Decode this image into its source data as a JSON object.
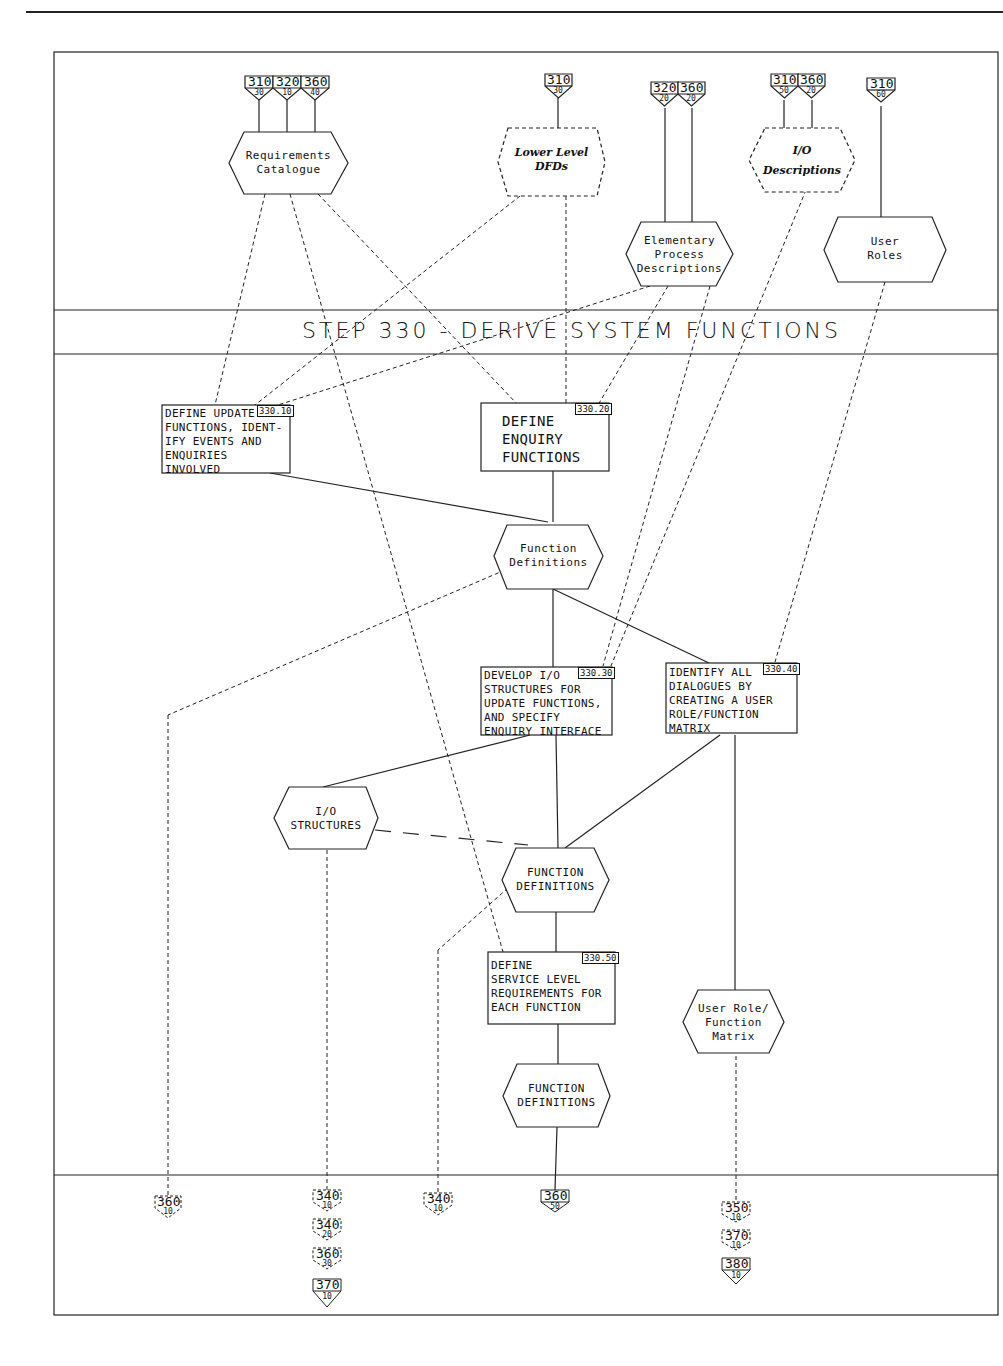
{
  "diagram": {
    "title": "STEP 330 - DERIVE SYSTEM FUNCTIONS",
    "inputs": [
      {
        "name": "requirements-catalogue",
        "label": "Requirements\nCatalogue",
        "style": "solid",
        "refs": [
          {
            "step": "310",
            "sub": "30"
          },
          {
            "step": "320",
            "sub": "10"
          },
          {
            "step": "360",
            "sub": "40"
          }
        ]
      },
      {
        "name": "lower-level-dfds",
        "label": "Lower Level\nDFDs",
        "style": "dashed-italic",
        "refs": [
          {
            "step": "310",
            "sub": "30"
          }
        ]
      },
      {
        "name": "elementary-process-descriptions",
        "label": "Elementary\nProcess\nDescriptions",
        "style": "solid",
        "refs": [
          {
            "step": "320",
            "sub": "20"
          },
          {
            "step": "360",
            "sub": "20"
          }
        ]
      },
      {
        "name": "io-descriptions",
        "label": "I/O\nDescriptions",
        "style": "dashed-italic",
        "refs": [
          {
            "step": "310",
            "sub": "50"
          },
          {
            "step": "360",
            "sub": "20"
          }
        ]
      },
      {
        "name": "user-roles",
        "label": "User\nRoles",
        "style": "solid",
        "refs": [
          {
            "step": "310",
            "sub": "60"
          }
        ]
      }
    ],
    "tasks": [
      {
        "id": "330.10",
        "text": "DEFINE UPDATE\nFUNCTIONS, IDENT-\nIFY EVENTS AND\nENQUIRIES\nINVOLVED"
      },
      {
        "id": "330.20",
        "text": "DEFINE\nENQUIRY\nFUNCTIONS"
      },
      {
        "id": "330.30",
        "text": "DEVELOP I/O\nSTRUCTURES FOR\nUPDATE FUNCTIONS,\n   AND SPECIFY\nENQUIRY INTERFACE"
      },
      {
        "id": "330.40",
        "text": "IDENTIFY ALL\nDIALOGUES BY\nCREATING A USER\nROLE/FUNCTION\nMATRIX"
      },
      {
        "id": "330.50",
        "text": "DEFINE\nSERVICE LEVEL\nREQUIREMENTS FOR\nEACH FUNCTION"
      }
    ],
    "products": [
      {
        "name": "function-definitions-1",
        "label": "Function\nDefinitions"
      },
      {
        "name": "io-structures",
        "label": "I/O\nSTRUCTURES"
      },
      {
        "name": "function-definitions-2",
        "label": "FUNCTION\nDEFINITIONS"
      },
      {
        "name": "user-role-function-matrix",
        "label": "User Role/\nFunction\nMatrix"
      },
      {
        "name": "function-definitions-3",
        "label": "FUNCTION\nDEFINITIONS"
      }
    ],
    "outputs": [
      {
        "refs": [
          {
            "step": "360",
            "sub": "10",
            "style": "dashed"
          }
        ]
      },
      {
        "refs": [
          {
            "step": "340",
            "sub": "10",
            "style": "dashed"
          },
          {
            "step": "340",
            "sub": "20",
            "style": "dashed"
          },
          {
            "step": "360",
            "sub": "30",
            "style": "dashed"
          },
          {
            "step": "370",
            "sub": "10",
            "style": "solid"
          }
        ]
      },
      {
        "refs": [
          {
            "step": "340",
            "sub": "10",
            "style": "dashed"
          }
        ]
      },
      {
        "refs": [
          {
            "step": "360",
            "sub": "50",
            "style": "solid"
          }
        ]
      },
      {
        "refs": [
          {
            "step": "350",
            "sub": "10",
            "style": "dashed"
          },
          {
            "step": "370",
            "sub": "10",
            "style": "dashed"
          },
          {
            "step": "380",
            "sub": "10",
            "style": "solid"
          }
        ]
      }
    ]
  }
}
